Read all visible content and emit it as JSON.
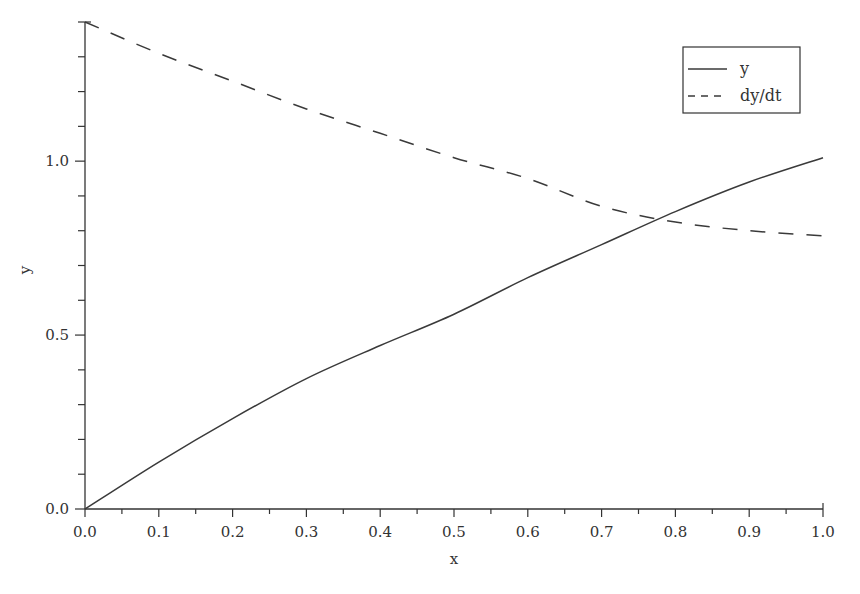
{
  "chart_data": {
    "type": "line",
    "title": "",
    "xlabel": "x",
    "ylabel": "y",
    "xlim": [
      0.0,
      1.0
    ],
    "ylim": [
      0.0,
      1.4
    ],
    "grid": false,
    "legend_position": "upper right",
    "x_ticks": [
      "0.0",
      "0.1",
      "0.2",
      "0.3",
      "0.4",
      "0.5",
      "0.6",
      "0.7",
      "0.8",
      "0.9",
      "1.0"
    ],
    "y_ticks": [
      "0.0",
      "0.5",
      "1.0"
    ],
    "x": [
      0.0,
      0.1,
      0.2,
      0.3,
      0.4,
      0.5,
      0.6,
      0.7,
      0.8,
      0.9,
      1.0
    ],
    "series": [
      {
        "name": "y",
        "style": "solid",
        "values": [
          0.0,
          0.135,
          0.26,
          0.375,
          0.47,
          0.56,
          0.665,
          0.76,
          0.855,
          0.94,
          1.01
        ]
      },
      {
        "name": "dy/dt",
        "style": "dashed",
        "values": [
          1.4,
          1.31,
          1.23,
          1.15,
          1.08,
          1.01,
          0.95,
          0.87,
          0.825,
          0.8,
          0.785
        ]
      }
    ]
  }
}
